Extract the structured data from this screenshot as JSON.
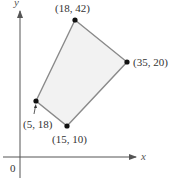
{
  "axes": {
    "x_label": "x",
    "y_label": "y",
    "origin_label": "0",
    "color": "#555555"
  },
  "polygon": {
    "fill": "#f2f2f2",
    "stroke": "#8a8a8a",
    "vertex_color": "#111111",
    "vertices": [
      {
        "label": "(18, 42)",
        "px": 75,
        "py": 20
      },
      {
        "label": "(35, 20)",
        "px": 127,
        "py": 62
      },
      {
        "label": "(15, 10)",
        "px": 67,
        "py": 126
      },
      {
        "label": "(5, 18)",
        "px": 36,
        "py": 101
      }
    ]
  }
}
